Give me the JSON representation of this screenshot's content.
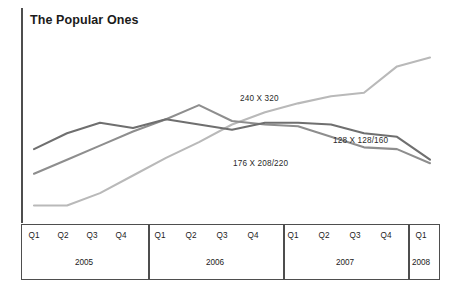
{
  "chart_data": {
    "type": "line",
    "title": "The Popular Ones",
    "xlabel": "",
    "ylabel": "",
    "grid": false,
    "legend_position": "inline-annotations",
    "x": [
      "Q1 2005",
      "Q2 2005",
      "Q3 2005",
      "Q4 2005",
      "Q1 2006",
      "Q2 2006",
      "Q3 2006",
      "Q4 2006",
      "Q1 2007",
      "Q2 2007",
      "Q3 2007",
      "Q4 2007",
      "Q1 2008"
    ],
    "categories": [
      "Q1",
      "Q2",
      "Q3",
      "Q4",
      "Q1",
      "Q2",
      "Q3",
      "Q4",
      "Q1",
      "Q2",
      "Q3",
      "Q4",
      "Q1"
    ],
    "ylim": [
      0,
      100
    ],
    "series": [
      {
        "name": "240 X 320",
        "color": "#b9b9b9",
        "values": [
          6,
          6,
          13,
          23,
          33,
          42,
          52,
          59,
          64,
          68,
          70,
          85,
          90
        ],
        "label_x": 240,
        "label_y": 94
      },
      {
        "name": "176 X 208/220",
        "color": "#8e8e8e",
        "values": [
          24,
          32,
          40,
          48,
          55,
          63,
          54,
          52,
          51,
          45,
          39,
          38,
          30
        ],
        "label_x": 233,
        "label_y": 159
      },
      {
        "name": "128 X 128/160",
        "color": "#6f6f6f",
        "values": [
          38,
          47,
          53,
          50,
          55,
          52,
          49,
          53,
          53,
          52,
          47,
          45,
          32
        ],
        "label_x": 333,
        "label_y": 136
      }
    ],
    "x_groups": [
      {
        "year": "2005",
        "quarters": [
          "Q1",
          "Q2",
          "Q3",
          "Q4"
        ]
      },
      {
        "year": "2006",
        "quarters": [
          "Q1",
          "Q2",
          "Q3",
          "Q4"
        ]
      },
      {
        "year": "2007",
        "quarters": [
          "Q1",
          "Q2",
          "Q3",
          "Q4"
        ]
      },
      {
        "year": "2008",
        "quarters": [
          "Q1"
        ]
      }
    ]
  },
  "axis": {
    "quarter_ticks": [
      {
        "label": "Q1",
        "x": 34
      },
      {
        "label": "Q2",
        "x": 63
      },
      {
        "label": "Q3",
        "x": 92
      },
      {
        "label": "Q4",
        "x": 121
      },
      {
        "label": "Q1",
        "x": 160
      },
      {
        "label": "Q2",
        "x": 191
      },
      {
        "label": "Q3",
        "x": 222
      },
      {
        "label": "Q4",
        "x": 253
      },
      {
        "label": "Q1",
        "x": 293
      },
      {
        "label": "Q2",
        "x": 324
      },
      {
        "label": "Q3",
        "x": 355
      },
      {
        "label": "Q4",
        "x": 386
      },
      {
        "label": "Q1",
        "x": 421
      }
    ],
    "year_ticks": [
      {
        "label": "2005",
        "x": 84
      },
      {
        "label": "2006",
        "x": 215
      },
      {
        "label": "2007",
        "x": 345
      },
      {
        "label": "2008",
        "x": 421
      }
    ],
    "dividers": [
      148,
      283,
      408
    ]
  }
}
